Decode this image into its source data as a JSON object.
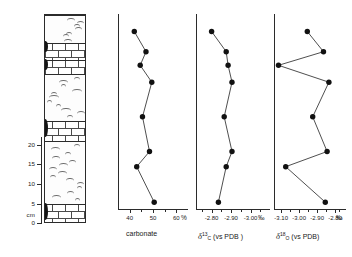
{
  "figure": {
    "title": "",
    "depth_scale": {
      "name": "depth-scale",
      "unit": "cm",
      "unit_label": "cm",
      "ticks": [
        0,
        5,
        10,
        15,
        20
      ],
      "tick_labels": [
        "0",
        "5",
        "10",
        "15",
        "20"
      ],
      "range_cm": [
        0,
        22
      ]
    },
    "lithology": {
      "name": "lithology-column",
      "legend_note": "",
      "beds": [
        {
          "id": "bed-1",
          "lithology": "marl",
          "top_px": 0,
          "height_px": 28,
          "pattern": "wavy-marl"
        },
        {
          "id": "bed-2",
          "lithology": "limestone",
          "top_px": 28,
          "height_px": 17,
          "pattern": "brick"
        },
        {
          "id": "bed-3",
          "lithology": "limestone",
          "top_px": 45,
          "height_px": 14,
          "pattern": "brick"
        },
        {
          "id": "bed-4",
          "lithology": "marl",
          "top_px": 59,
          "height_px": 47,
          "pattern": "wavy-marl"
        },
        {
          "id": "bed-5",
          "lithology": "limestone",
          "top_px": 106,
          "height_px": 20,
          "pattern": "brick"
        },
        {
          "id": "bed-6",
          "lithology": "marl",
          "top_px": 126,
          "height_px": 63,
          "pattern": "wavy-marl"
        },
        {
          "id": "bed-7",
          "lithology": "limestone",
          "top_px": 189,
          "height_px": 19,
          "pattern": "brick"
        }
      ],
      "nodules": [
        {
          "id": "nodule-1",
          "top_px": 26,
          "height_px": 11
        },
        {
          "id": "nodule-2",
          "top_px": 44,
          "height_px": 11
        },
        {
          "id": "nodule-3",
          "top_px": 104,
          "height_px": 18
        },
        {
          "id": "nodule-4",
          "top_px": 188,
          "height_px": 17
        }
      ]
    }
  },
  "chart_data": [
    {
      "name": "carbonate-profile",
      "type": "line",
      "orientation": "vertical-profile",
      "title": "carbonate",
      "xlabel": "carbonate",
      "ylabel": "depth (cm)",
      "x_unit": "%",
      "unit_symbol": "%",
      "xlim": [
        35,
        65
      ],
      "xticks": [
        40,
        50,
        60
      ],
      "xtick_labels": [
        "40",
        "50",
        "60"
      ],
      "minor_xticks": [
        45,
        55
      ],
      "ylim_cm": [
        0,
        22
      ],
      "grid": false,
      "legend": "none",
      "marker": "filled-circle",
      "points": [
        {
          "depth_cm": 21.0,
          "value": 42.0
        },
        {
          "depth_cm": 18.6,
          "value": 47.0
        },
        {
          "depth_cm": 17.0,
          "value": 44.5
        },
        {
          "depth_cm": 15.0,
          "value": 49.5
        },
        {
          "depth_cm": 10.9,
          "value": 45.5
        },
        {
          "depth_cm": 6.8,
          "value": 48.5
        },
        {
          "depth_cm": 5.0,
          "value": 43.0
        },
        {
          "depth_cm": 0.8,
          "value": 50.5
        }
      ]
    },
    {
      "name": "d13c-profile",
      "type": "line",
      "orientation": "vertical-profile",
      "title": "d13C (vs PDB)",
      "xlabel_parts": {
        "delta": "δ",
        "sup": "13",
        "sub": "C",
        "ref": "(vs PDB )"
      },
      "ylabel": "depth (cm)",
      "x_unit": "permil",
      "unit_symbol": "‰",
      "xlim": [
        -2.72,
        -3.1
      ],
      "xticks": [
        -2.8,
        -2.9,
        -3.0
      ],
      "xtick_labels": [
        "-2.80",
        "-2.90",
        "-3.00"
      ],
      "minor_xticks": [
        -2.75,
        -2.85,
        -2.95,
        -3.05
      ],
      "ylim_cm": [
        0,
        22
      ],
      "grid": false,
      "legend": "none",
      "marker": "filled-circle",
      "points": [
        {
          "depth_cm": 21.0,
          "value": -2.8
        },
        {
          "depth_cm": 18.6,
          "value": -2.875
        },
        {
          "depth_cm": 17.0,
          "value": -2.885
        },
        {
          "depth_cm": 15.0,
          "value": -2.905
        },
        {
          "depth_cm": 10.9,
          "value": -2.865
        },
        {
          "depth_cm": 6.8,
          "value": -2.905
        },
        {
          "depth_cm": 5.0,
          "value": -2.875
        },
        {
          "depth_cm": 0.8,
          "value": -2.835
        }
      ]
    },
    {
      "name": "d18o-profile",
      "type": "line",
      "orientation": "vertical-profile",
      "title": "d18O (vs PDB)",
      "xlabel_parts": {
        "delta": "δ",
        "sup": "18",
        "sub": "O",
        "ref": "(vs PDB)"
      },
      "ylabel": "depth (cm)",
      "x_unit": "permil",
      "unit_symbol": "‰",
      "xlim": [
        -3.14,
        -2.74
      ],
      "xticks": [
        -3.1,
        -3.0,
        -2.9,
        -2.8
      ],
      "xtick_labels": [
        "-3.10",
        "-3.00",
        "-2.90",
        "-2.80"
      ],
      "minor_xticks": [
        -3.05,
        -2.95,
        -2.85,
        -2.78
      ],
      "ylim_cm": [
        0,
        22
      ],
      "grid": false,
      "legend": "none",
      "marker": "filled-circle",
      "points": [
        {
          "depth_cm": 21.0,
          "value": -2.955
        },
        {
          "depth_cm": 18.6,
          "value": -2.865
        },
        {
          "depth_cm": 17.0,
          "value": -3.115
        },
        {
          "depth_cm": 15.0,
          "value": -2.835
        },
        {
          "depth_cm": 10.9,
          "value": -2.925
        },
        {
          "depth_cm": 6.8,
          "value": -2.845
        },
        {
          "depth_cm": 5.0,
          "value": -3.075
        },
        {
          "depth_cm": 0.8,
          "value": -2.855
        }
      ]
    }
  ]
}
